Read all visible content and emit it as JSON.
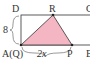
{
  "diagram": {
    "type": "geometry",
    "shape": "rectangle ABCD with shaded triangle QRP",
    "colors": {
      "line": "#333333",
      "fill": "#f4b6c2",
      "background": "#ffffff"
    },
    "points": {
      "D": {
        "label": "D",
        "x": 21,
        "y": 15
      },
      "C": {
        "label": "C",
        "x": 90,
        "y": 15
      },
      "A": {
        "label": "A(Q)",
        "x": 21,
        "y": 45
      },
      "B": {
        "label": "B",
        "x": 90,
        "y": 45
      },
      "R": {
        "label": "R",
        "x": 53,
        "y": 15
      },
      "P": {
        "label": "P",
        "x": 72,
        "y": 45
      }
    },
    "dimensions": {
      "side_AD": "8",
      "segment_QP": "2x"
    },
    "labels": {
      "D": "D",
      "C": "C",
      "A": "A(Q)",
      "B": "B",
      "R": "R",
      "P": "P",
      "height": "8",
      "base": "2x"
    }
  }
}
